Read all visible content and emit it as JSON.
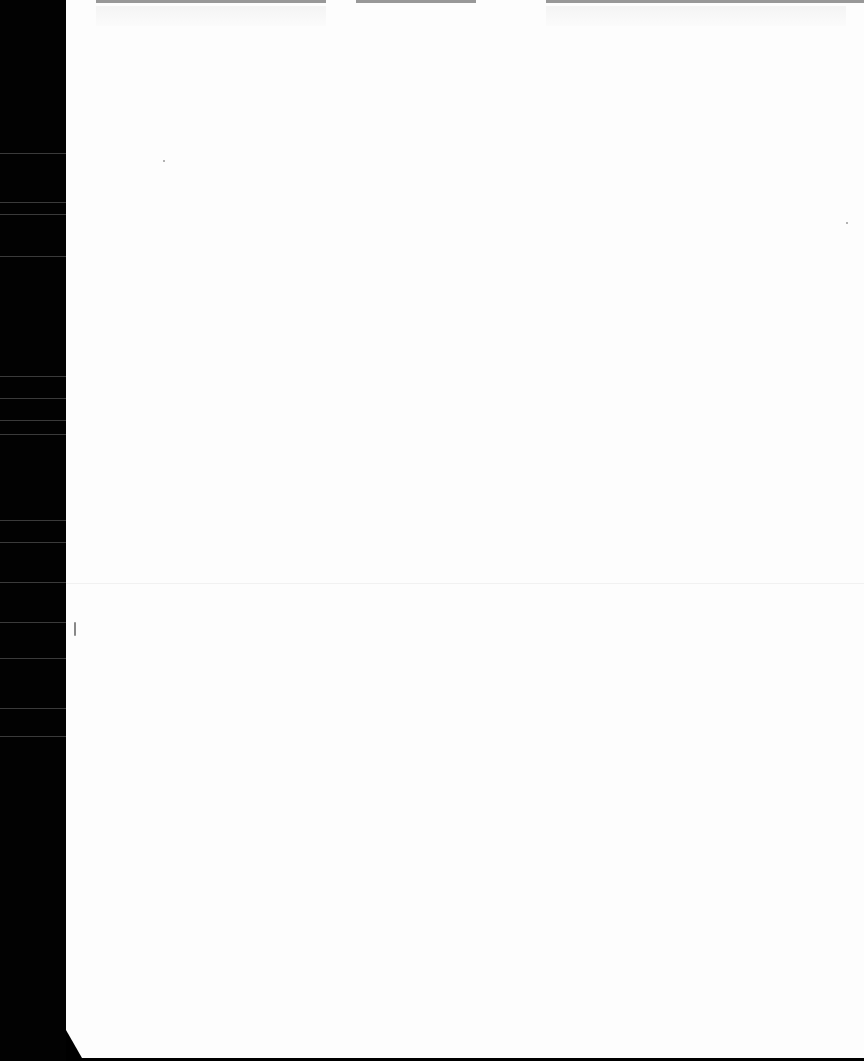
{
  "document": {
    "type": "scanned blank page",
    "visible_text": "",
    "background_color": "#fdfdfd",
    "scanner_edge_color": "#000000"
  }
}
